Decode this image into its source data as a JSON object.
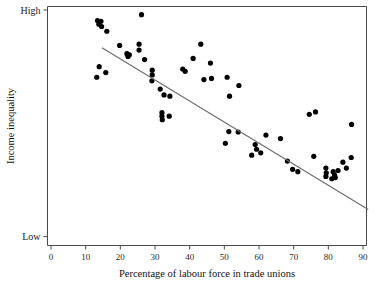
{
  "chart_data": {
    "type": "scatter",
    "title": "",
    "xlabel": "Percentage of labour force in trade unions",
    "ylabel": "Income inequality",
    "xlim": [
      0,
      90
    ],
    "ylim": [
      0,
      100
    ],
    "grid": false,
    "legend": "none",
    "x_ticks": [
      "0",
      "10",
      "20",
      "30",
      "40",
      "50",
      "60",
      "70",
      "80",
      "90"
    ],
    "x_tick_values": [
      0,
      10,
      20,
      30,
      40,
      50,
      60,
      70,
      80,
      90
    ],
    "y_ticks": [
      "High",
      "Low"
    ],
    "y_tick_values": [
      100,
      4
    ],
    "y_axis_note": "ordinal scale labelled only at extremes: High at top, Low at bottom",
    "series": [
      {
        "name": "countries",
        "marker": "filled-circle",
        "color": "#000000",
        "points": [
          [
            13.4,
            95.5
          ],
          [
            13.8,
            94.0
          ],
          [
            14.4,
            95.2
          ],
          [
            14.6,
            93.0
          ],
          [
            16.1,
            91.0
          ],
          [
            26.1,
            98.0
          ],
          [
            19.8,
            85.0
          ],
          [
            25.4,
            85.5
          ],
          [
            25.4,
            83.0
          ],
          [
            21.9,
            81.5
          ],
          [
            22.6,
            81.0
          ],
          [
            22.2,
            80.3
          ],
          [
            27.0,
            79.0
          ],
          [
            43.2,
            85.5
          ],
          [
            41.0,
            79.5
          ],
          [
            46.0,
            77.5
          ],
          [
            13.9,
            76.0
          ],
          [
            15.8,
            73.5
          ],
          [
            13.2,
            71.5
          ],
          [
            29.2,
            74.5
          ],
          [
            29.2,
            72.5
          ],
          [
            29.1,
            70.0
          ],
          [
            38.0,
            75.0
          ],
          [
            38.7,
            74.0
          ],
          [
            44.1,
            70.5
          ],
          [
            46.3,
            71.0
          ],
          [
            50.8,
            71.5
          ],
          [
            31.5,
            66.5
          ],
          [
            54.2,
            68.0
          ],
          [
            32.6,
            64.0
          ],
          [
            34.3,
            63.5
          ],
          [
            51.5,
            63.5
          ],
          [
            32.0,
            56.5
          ],
          [
            32.0,
            55.0
          ],
          [
            32.1,
            53.5
          ],
          [
            34.1,
            55.0
          ],
          [
            74.5,
            55.8
          ],
          [
            76.3,
            56.8
          ],
          [
            86.7,
            51.5
          ],
          [
            51.3,
            48.5
          ],
          [
            54.0,
            48.3
          ],
          [
            62.0,
            47.0
          ],
          [
            66.2,
            45.5
          ],
          [
            50.3,
            43.5
          ],
          [
            58.9,
            43.0
          ],
          [
            59.3,
            41.0
          ],
          [
            57.9,
            38.5
          ],
          [
            60.5,
            39.5
          ],
          [
            75.8,
            38.0
          ],
          [
            68.2,
            36.0
          ],
          [
            86.6,
            37.5
          ],
          [
            84.2,
            35.5
          ],
          [
            69.7,
            32.5
          ],
          [
            71.2,
            31.5
          ],
          [
            85.2,
            33.0
          ],
          [
            79.3,
            33.0
          ],
          [
            79.4,
            31.0
          ],
          [
            79.3,
            29.5
          ],
          [
            81.4,
            31.5
          ],
          [
            81.8,
            30.0
          ],
          [
            82.0,
            29.0
          ],
          [
            81.0,
            28.5
          ],
          [
            82.8,
            32.0
          ]
        ]
      }
    ],
    "trendline": {
      "type": "linear-fit",
      "color": "#6e6e6e",
      "x_start": 14.7,
      "y_start": 84.0,
      "x_end": 91.5,
      "y_end": 15.5
    }
  }
}
